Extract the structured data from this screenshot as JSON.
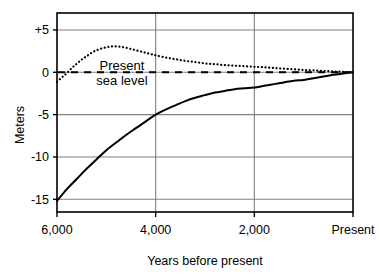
{
  "chart_data": {
    "type": "line",
    "title": "",
    "subtitle": "",
    "xlabel": "Years before present",
    "ylabel": "Meters",
    "xlim": [
      6000,
      0
    ],
    "ylim": [
      -16.5,
      7.0
    ],
    "x_tick_values": [
      6000,
      4000,
      2000,
      0
    ],
    "x_tick_labels": [
      "6,000",
      "4,000",
      "2,000",
      "Present"
    ],
    "y_tick_values": [
      5,
      0,
      -5,
      -10,
      -15
    ],
    "y_tick_labels": [
      "+5",
      "0",
      "-5",
      "-10",
      "-15"
    ],
    "grid": "both",
    "legend_position": "none",
    "annotations": [
      {
        "name": "present-sea-level",
        "line1": "Present",
        "line2": "sea level",
        "x": 3650,
        "y": 1.6
      }
    ],
    "reference_lines": [
      {
        "name": "present-sea-level-line",
        "orientation": "horizontal",
        "value": 0,
        "style": "dashed",
        "color": "#000000"
      }
    ],
    "series": [
      {
        "name": "Eustatic sea level (solid)",
        "style": "solid",
        "color": "#000000",
        "points": [
          [
            6000,
            -15.2
          ],
          [
            5800,
            -13.8
          ],
          [
            5600,
            -12.6
          ],
          [
            5400,
            -11.4
          ],
          [
            5200,
            -10.3
          ],
          [
            5000,
            -9.2
          ],
          [
            4800,
            -8.3
          ],
          [
            4600,
            -7.4
          ],
          [
            4400,
            -6.6
          ],
          [
            4200,
            -5.8
          ],
          [
            4000,
            -5.0
          ],
          [
            3800,
            -4.4
          ],
          [
            3600,
            -3.9
          ],
          [
            3400,
            -3.4
          ],
          [
            3200,
            -3.0
          ],
          [
            3000,
            -2.7
          ],
          [
            2800,
            -2.4
          ],
          [
            2600,
            -2.2
          ],
          [
            2400,
            -2.0
          ],
          [
            2200,
            -1.9
          ],
          [
            2000,
            -1.8
          ],
          [
            1800,
            -1.6
          ],
          [
            1600,
            -1.4
          ],
          [
            1400,
            -1.2
          ],
          [
            1200,
            -1.0
          ],
          [
            1000,
            -0.9
          ],
          [
            800,
            -0.7
          ],
          [
            600,
            -0.5
          ],
          [
            400,
            -0.3
          ],
          [
            200,
            -0.15
          ],
          [
            0,
            0
          ]
        ]
      },
      {
        "name": "Local relative sea level (dotted)",
        "style": "dotted",
        "color": "#000000",
        "points": [
          [
            6000,
            -1.1
          ],
          [
            5900,
            -0.6
          ],
          [
            5800,
            -0.1
          ],
          [
            5700,
            0.5
          ],
          [
            5600,
            1.0
          ],
          [
            5500,
            1.5
          ],
          [
            5400,
            1.9
          ],
          [
            5300,
            2.3
          ],
          [
            5200,
            2.6
          ],
          [
            5100,
            2.8
          ],
          [
            5000,
            2.95
          ],
          [
            4900,
            3.05
          ],
          [
            4800,
            3.05
          ],
          [
            4700,
            3.0
          ],
          [
            4600,
            2.9
          ],
          [
            4500,
            2.75
          ],
          [
            4400,
            2.6
          ],
          [
            4300,
            2.45
          ],
          [
            4200,
            2.3
          ],
          [
            4100,
            2.15
          ],
          [
            4000,
            2.0
          ],
          [
            3800,
            1.75
          ],
          [
            3600,
            1.55
          ],
          [
            3400,
            1.35
          ],
          [
            3200,
            1.2
          ],
          [
            3000,
            1.05
          ],
          [
            2800,
            0.95
          ],
          [
            2600,
            0.85
          ],
          [
            2400,
            0.78
          ],
          [
            2200,
            0.72
          ],
          [
            2000,
            0.65
          ],
          [
            1800,
            0.58
          ],
          [
            1600,
            0.5
          ],
          [
            1400,
            0.42
          ],
          [
            1200,
            0.35
          ],
          [
            1000,
            0.28
          ],
          [
            800,
            0.22
          ],
          [
            600,
            0.16
          ],
          [
            400,
            0.1
          ],
          [
            200,
            0.05
          ],
          [
            0,
            0
          ]
        ]
      }
    ],
    "colors": {
      "axis": "#000000",
      "grid": "#808080",
      "background": "#ffffff",
      "curve": "#000000"
    }
  }
}
